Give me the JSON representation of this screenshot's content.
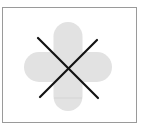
{
  "image": {
    "description": "Cross-out symbol over a rounded plus shape inside a bordered frame",
    "frame": {
      "border_color": "#9a9a9a",
      "background": "#ffffff"
    },
    "plus_shape": {
      "fill": "#e2e2e2",
      "center": [
        68,
        66
      ],
      "arm_width": 29,
      "horizontal_extent": [
        24,
        112
      ],
      "vertical_extent": [
        22,
        111
      ],
      "seam_y": 98,
      "seam_color": "#d4d4d4"
    },
    "cross_out": {
      "stroke": "#111111",
      "stroke_width": 2.2,
      "line1": [
        [
          38,
          38
        ],
        [
          98,
          98
        ]
      ],
      "line2": [
        [
          97,
          40
        ],
        [
          40,
          97
        ]
      ]
    }
  }
}
